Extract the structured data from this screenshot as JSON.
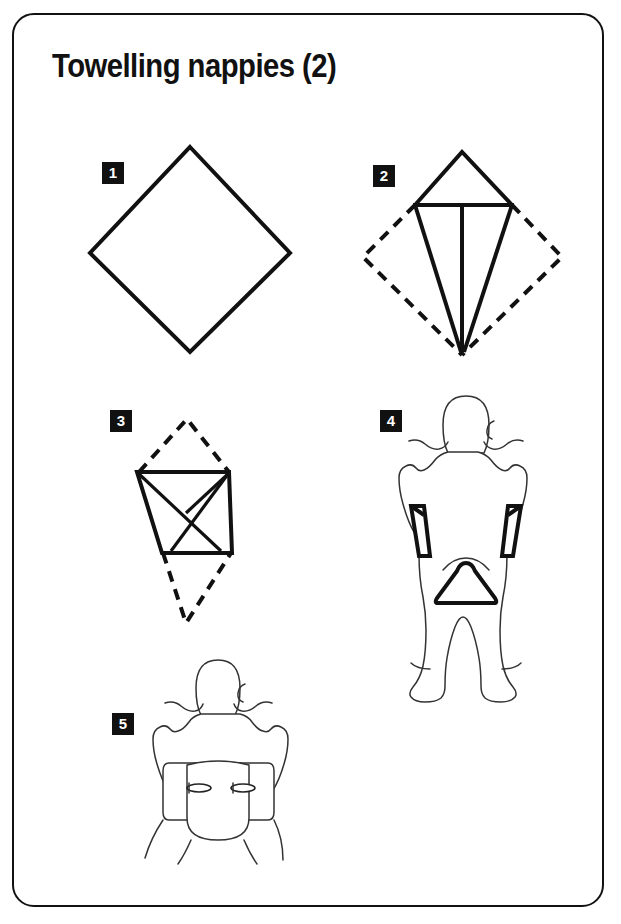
{
  "page": {
    "title": "Towelling nappies (2)",
    "border_color": "#111111",
    "ink_color": "#111111",
    "background_color": "#ffffff",
    "width": 621,
    "height": 924
  },
  "steps": [
    {
      "number": "1",
      "badge_label": "1",
      "caption": "",
      "figure": "plain-square-nappy-diamond",
      "description": "Nappy laid flat as a diamond with no folds"
    },
    {
      "number": "2",
      "badge_label": "2",
      "caption": "",
      "figure": "kite-fold-with-dashed-original-outline",
      "description": "Side corners folded to the centre forming a kite; dashed lines show the original diamond outline"
    },
    {
      "number": "3",
      "badge_label": "3",
      "caption": "",
      "figure": "trapezoid-fold-with-dashed-tips",
      "description": "Top and bottom points folded in forming a trapezoid; dashed lines show the folded-away tips"
    },
    {
      "number": "4",
      "badge_label": "4",
      "caption": "",
      "figure": "baby-with-nappy-being-positioned",
      "description": "Baby lying on the folded nappy, the wings brought up at the hips and the tongue drawn between the legs"
    },
    {
      "number": "5",
      "badge_label": "5",
      "caption": "",
      "figure": "baby-with-nappy-pinned",
      "description": "Completed nappy fastened at each hip with a safety pin"
    }
  ],
  "icons": {
    "step_badge": "numbered-square-badge",
    "safety_pin": "safety-pin-icon"
  }
}
